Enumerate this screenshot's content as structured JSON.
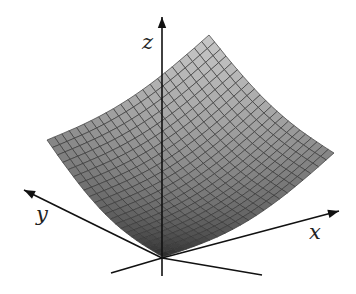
{
  "figure": {
    "type": "3d-surface",
    "axes": {
      "x_label": "x",
      "y_label": "y",
      "z_label": "z"
    },
    "mesh": {
      "divisions": 22
    },
    "colors": {
      "axis": "#111111",
      "mesh_line": "#3a3a3a",
      "shade_light": "#c8c8c8",
      "shade_dark": "#262626"
    }
  }
}
